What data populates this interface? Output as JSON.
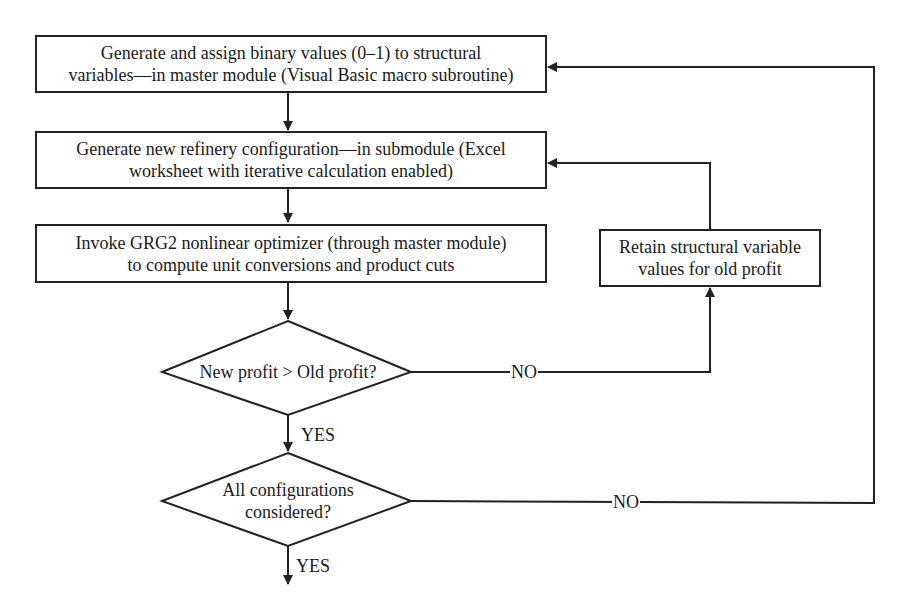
{
  "flowchart": {
    "nodes": {
      "generate_binary": {
        "type": "process",
        "line1": "Generate and assign binary values (0–1) to structural",
        "line2": "variables—in master module (Visual Basic macro subroutine)"
      },
      "new_configuration": {
        "type": "process",
        "line1": "Generate new refinery configuration—in submodule (Excel",
        "line2": "worksheet with iterative calculation enabled)"
      },
      "invoke_grg2": {
        "type": "process",
        "line1": "Invoke GRG2 nonlinear optimizer (through master module)",
        "line2": "to compute unit conversions and product cuts"
      },
      "retain_values": {
        "type": "process",
        "line1": "Retain structural variable",
        "line2": "values for old profit"
      },
      "profit_decision": {
        "type": "decision",
        "line1": "New profit > Old profit?"
      },
      "all_configs_decision": {
        "type": "decision",
        "line1": "All configurations",
        "line2": "considered?"
      }
    },
    "edge_labels": {
      "profit_no": "NO",
      "profit_yes": "YES",
      "all_no": "NO",
      "all_yes": "YES"
    },
    "edges": [
      {
        "from": "generate_binary",
        "to": "new_configuration",
        "label": ""
      },
      {
        "from": "new_configuration",
        "to": "invoke_grg2",
        "label": ""
      },
      {
        "from": "invoke_grg2",
        "to": "profit_decision",
        "label": ""
      },
      {
        "from": "profit_decision",
        "to": "retain_values",
        "label": "NO"
      },
      {
        "from": "retain_values",
        "to": "new_configuration",
        "label": ""
      },
      {
        "from": "profit_decision",
        "to": "all_configs_decision",
        "label": "YES"
      },
      {
        "from": "all_configs_decision",
        "to": "generate_binary",
        "label": "NO"
      },
      {
        "from": "all_configs_decision",
        "to": "exit",
        "label": "YES"
      }
    ],
    "colors": {
      "stroke": "#222222",
      "background": "#ffffff",
      "text": "#1a1a1a"
    }
  }
}
